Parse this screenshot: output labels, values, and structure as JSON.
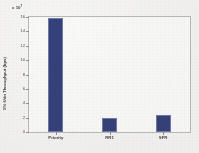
{
  "chart_data": {
    "type": "bar",
    "title": "",
    "subtitle": "",
    "categories": [
      "Priority",
      "RR1",
      "SFR"
    ],
    "values": [
      15.8,
      1.9,
      2.4
    ],
    "xlabel": "",
    "ylabel": "5% Udn Throughput (bps)",
    "y_multiplier_text": "x 10",
    "y_multiplier_exponent": "7",
    "ylim": [
      0,
      16
    ],
    "yticks": [
      0,
      2,
      4,
      6,
      8,
      10,
      12,
      14,
      16
    ],
    "ytick_labels": [
      "0",
      "2",
      "4",
      "6",
      "8",
      "10",
      "12",
      "14",
      "16"
    ],
    "grid": false,
    "legend": null,
    "legend_position": "none",
    "series_color": "#2e3b77",
    "bar_edge_color": "#6f76a3",
    "plot_background": "#fdfdfc",
    "frame_color": "#b9b9bb",
    "page_background": "#f2f1ef"
  }
}
